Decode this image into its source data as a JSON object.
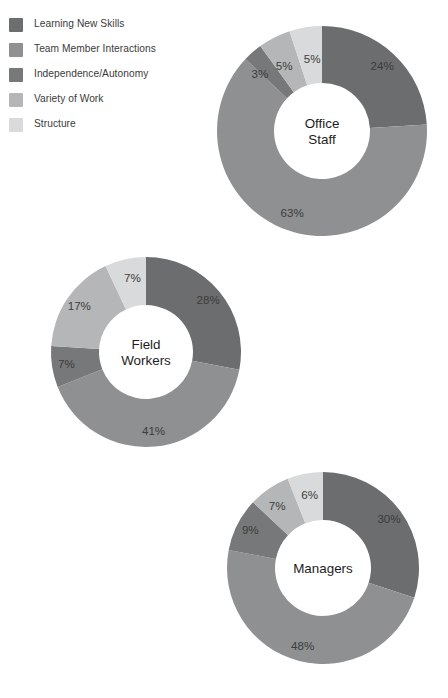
{
  "legend": {
    "items": [
      {
        "label": "Learning New Skills",
        "color": "#6b6d6e",
        "icon": "color-swatch-icon"
      },
      {
        "label": "Team Member Interactions",
        "color": "#8e9092",
        "icon": "color-swatch-icon"
      },
      {
        "label": "Independence/Autonomy",
        "color": "#767879",
        "icon": "color-swatch-icon"
      },
      {
        "label": "Variety of Work",
        "color": "#b4b6b7",
        "icon": "color-swatch-icon"
      },
      {
        "label": "Structure",
        "color": "#d9dadb",
        "icon": "color-swatch-icon"
      }
    ]
  },
  "chart_data": {
    "type": "pie",
    "variant": "donut",
    "title": "",
    "subtitle": "",
    "xlabel": "",
    "ylabel": "",
    "grid": false,
    "legend_position": "top-left",
    "value_suffix": "%",
    "categories": [
      "Learning New Skills",
      "Team Member Interactions",
      "Independence/Autonomy",
      "Variety of Work",
      "Structure"
    ],
    "colors": [
      "#6b6d6e",
      "#8e9092",
      "#767879",
      "#b4b6b7",
      "#d9dadb"
    ],
    "charts": [
      {
        "name": "office-staff",
        "center_label": "Office Staff",
        "center_lines": [
          "Office",
          "Staff"
        ],
        "values": [
          24,
          63,
          3,
          5,
          5
        ],
        "labels": [
          "24%",
          "63%",
          "3%",
          "5%",
          "5%"
        ],
        "geometry": {
          "cx": 322,
          "cy": 131,
          "r_outer": 105,
          "r_inner": 48
        },
        "label_overrides": [
          {
            "index": 0,
            "dx": 0,
            "dy": 0
          },
          {
            "index": 1,
            "dx": 0,
            "dy": 0
          },
          {
            "index": 2,
            "dx": -4,
            "dy": 10
          },
          {
            "index": 3,
            "dx": 2,
            "dy": 14
          },
          {
            "index": 4,
            "dx": 4,
            "dy": 16
          }
        ]
      },
      {
        "name": "field-workers",
        "center_label": "Field Workers",
        "center_lines": [
          "Field",
          "Workers"
        ],
        "values": [
          28,
          41,
          7,
          17,
          7
        ],
        "labels": [
          "28%",
          "41%",
          "7%",
          "17%",
          "7%"
        ],
        "geometry": {
          "cx": 146,
          "cy": 352,
          "r_outer": 95,
          "r_inner": 47
        },
        "label_overrides": [
          {
            "index": 0,
            "dx": 0,
            "dy": 0
          },
          {
            "index": 1,
            "dx": 0,
            "dy": 0
          },
          {
            "index": 2,
            "dx": 0,
            "dy": 0
          },
          {
            "index": 3,
            "dx": 0,
            "dy": 0
          },
          {
            "index": 4,
            "dx": 4,
            "dy": 6
          }
        ]
      },
      {
        "name": "managers",
        "center_label": "Managers",
        "center_lines": [
          "Managers"
        ],
        "values": [
          30,
          48,
          9,
          7,
          6
        ],
        "labels": [
          "30%",
          "48%",
          "9%",
          "7%",
          "6%"
        ],
        "geometry": {
          "cx": 323,
          "cy": 568,
          "r_outer": 96,
          "r_inner": 48
        },
        "label_overrides": [
          {
            "index": 0,
            "dx": 0,
            "dy": 0
          },
          {
            "index": 1,
            "dx": 0,
            "dy": 0
          },
          {
            "index": 2,
            "dx": 0,
            "dy": 0
          },
          {
            "index": 3,
            "dx": 0,
            "dy": 6
          },
          {
            "index": 4,
            "dx": 2,
            "dy": 8
          }
        ]
      }
    ]
  }
}
